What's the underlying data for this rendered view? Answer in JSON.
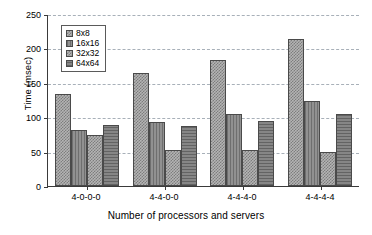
{
  "chart_data": {
    "type": "bar",
    "title": "",
    "xlabel": "Number of processors and servers",
    "ylabel": "Time (msec)",
    "categories": [
      "4-0-0-0",
      "4-4-0-0",
      "4-4-4-0",
      "4-4-4-4"
    ],
    "series": [
      {
        "name": "8x8",
        "values": [
          134,
          164,
          183,
          214
        ]
      },
      {
        "name": "16x16",
        "values": [
          81,
          93,
          104,
          124
        ]
      },
      {
        "name": "32x32",
        "values": [
          74,
          53,
          53,
          50
        ]
      },
      {
        "name": "64x64",
        "values": [
          88,
          87,
          94,
          105
        ]
      }
    ],
    "ylim": [
      0,
      250
    ],
    "yticks": [
      0,
      50,
      100,
      150,
      200,
      250
    ],
    "ytick_labels": [
      "0",
      "50",
      "100",
      "150",
      "200",
      "250"
    ],
    "grid": true,
    "grid_style": "dashed-horizontal",
    "legend_position": "upper-left-inside",
    "bar_colors": [
      "#b4b4b4",
      "#8b8b8b",
      "#b4b4b4",
      "#7a7a7a"
    ],
    "axis_color": "#3a3a3a",
    "gridline_color": "#9aa3ad",
    "background": "#ffffff"
  }
}
